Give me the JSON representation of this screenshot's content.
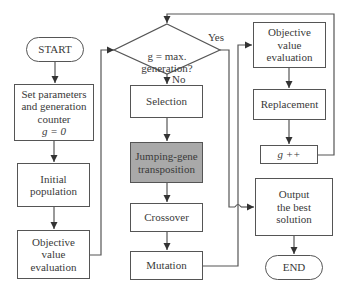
{
  "diagram": {
    "type": "flowchart",
    "colors": {
      "line": "#555555",
      "node_fill": "#ffffff",
      "highlight_fill": "#a9a9a9",
      "text": "#3a3a3a"
    },
    "nodes": {
      "start": "START",
      "set_parameters": "Set parameters\nand generation\ncounter",
      "set_parameters_eq": "g = 0",
      "initial_population": "Initial\npopulation",
      "objective_eval_initial": "Objective\nvalue\nevaluation",
      "decision": "g = max.\ngeneration?",
      "selection": "Selection",
      "jumping_gene": "Jumping-gene\ntransposition",
      "crossover": "Crossover",
      "mutation": "Mutation",
      "objective_eval_loop": "Objective\nvalue\nevaluation",
      "replacement": "Replacement",
      "increment": "g ++",
      "output": "Output\nthe best\nsolution",
      "end": "END"
    },
    "edge_labels": {
      "yes": "Yes",
      "no": "No"
    },
    "edges": [
      [
        "start",
        "set_parameters"
      ],
      [
        "set_parameters",
        "initial_population"
      ],
      [
        "initial_population",
        "objective_eval_initial"
      ],
      [
        "objective_eval_initial",
        "decision"
      ],
      [
        "decision",
        "selection",
        "No"
      ],
      [
        "decision",
        "output",
        "Yes"
      ],
      [
        "selection",
        "jumping_gene"
      ],
      [
        "jumping_gene",
        "crossover"
      ],
      [
        "crossover",
        "mutation"
      ],
      [
        "mutation",
        "objective_eval_loop"
      ],
      [
        "objective_eval_loop",
        "replacement"
      ],
      [
        "replacement",
        "increment"
      ],
      [
        "increment",
        "decision"
      ],
      [
        "output",
        "end"
      ]
    ]
  }
}
